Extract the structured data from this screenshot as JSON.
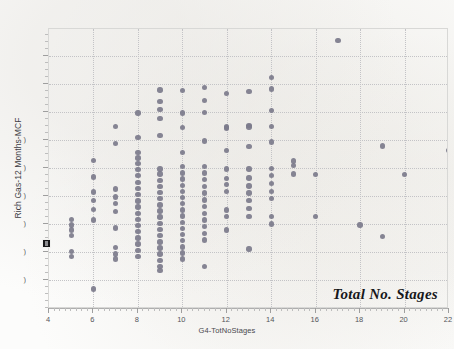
{
  "chart_data": {
    "type": "scatter",
    "title": "",
    "annotation": "Total No. Stages",
    "xlabel": "G4-TotNoStages",
    "ylabel": "Rich Gas-12 Months-MCF",
    "xlim": [
      4,
      22
    ],
    "ylim": [
      0,
      1
    ],
    "grid": true,
    "legend": null,
    "x_ticks": [
      4,
      6,
      8,
      10,
      12,
      14,
      16,
      18,
      20,
      22
    ],
    "x_tick_labels": [
      "4",
      "6",
      "8",
      "10",
      "12",
      "14",
      "16",
      "18",
      "20",
      "22"
    ],
    "x_minor_tick_step": 0.25,
    "y_ticks": [
      0.105,
      0.205,
      0.305,
      0.405,
      0.505,
      0.605,
      0.705,
      0.805,
      0.905
    ],
    "y_tick_labels": [
      "(",
      "(",
      "(",
      "(",
      "(",
      "(",
      "",
      "",
      ""
    ],
    "y_tick_labels_note": "y-axis numeric labels are clipped at the left edge of the screenshot; only partial glyph fragments are visible",
    "marker_color": "#7c7b8b",
    "marker_size_px": 5.4,
    "gridline_color": "#c3c3c6",
    "axis_color": "#aeaeae",
    "series": [
      {
        "name": "Rich Gas-12 Months-MCF vs Total No. Stages",
        "points": [
          [
            5,
            0.32
          ],
          [
            5,
            0.3
          ],
          [
            5,
            0.282
          ],
          [
            5,
            0.262
          ],
          [
            5,
            0.206
          ],
          [
            5,
            0.188
          ],
          [
            6,
            0.53
          ],
          [
            6,
            0.472
          ],
          [
            6,
            0.418
          ],
          [
            6,
            0.388
          ],
          [
            6,
            0.356
          ],
          [
            6,
            0.318
          ],
          [
            6,
            0.072
          ],
          [
            7,
            0.652
          ],
          [
            7,
            0.592
          ],
          [
            7,
            0.428
          ],
          [
            7,
            0.4
          ],
          [
            7,
            0.376
          ],
          [
            7,
            0.348
          ],
          [
            7,
            0.29
          ],
          [
            7,
            0.22
          ],
          [
            7,
            0.196
          ],
          [
            7,
            0.178
          ],
          [
            8,
            0.7
          ],
          [
            8,
            0.612
          ],
          [
            8,
            0.56
          ],
          [
            8,
            0.54
          ],
          [
            8,
            0.52
          ],
          [
            8,
            0.498
          ],
          [
            8,
            0.476
          ],
          [
            8,
            0.452
          ],
          [
            8,
            0.43
          ],
          [
            8,
            0.408
          ],
          [
            8,
            0.386
          ],
          [
            8,
            0.364
          ],
          [
            8,
            0.342
          ],
          [
            8,
            0.32
          ],
          [
            8,
            0.298
          ],
          [
            8,
            0.276
          ],
          [
            8,
            0.254
          ],
          [
            8,
            0.232
          ],
          [
            8,
            0.21
          ],
          [
            8,
            0.188
          ],
          [
            9,
            0.782
          ],
          [
            9,
            0.742
          ],
          [
            9,
            0.712
          ],
          [
            9,
            0.68
          ],
          [
            9,
            0.62
          ],
          [
            9,
            0.5
          ],
          [
            9,
            0.482
          ],
          [
            9,
            0.46
          ],
          [
            9,
            0.438
          ],
          [
            9,
            0.416
          ],
          [
            9,
            0.394
          ],
          [
            9,
            0.372
          ],
          [
            9,
            0.35
          ],
          [
            9,
            0.328
          ],
          [
            9,
            0.306
          ],
          [
            9,
            0.284
          ],
          [
            9,
            0.262
          ],
          [
            9,
            0.24
          ],
          [
            9,
            0.218
          ],
          [
            9,
            0.196
          ],
          [
            9,
            0.174
          ],
          [
            9,
            0.152
          ],
          [
            9,
            0.138
          ],
          [
            10,
            0.78
          ],
          [
            10,
            0.7
          ],
          [
            10,
            0.648
          ],
          [
            10,
            0.56
          ],
          [
            10,
            0.51
          ],
          [
            10,
            0.486
          ],
          [
            10,
            0.464
          ],
          [
            10,
            0.442
          ],
          [
            10,
            0.42
          ],
          [
            10,
            0.398
          ],
          [
            10,
            0.376
          ],
          [
            10,
            0.354
          ],
          [
            10,
            0.332
          ],
          [
            10,
            0.31
          ],
          [
            10,
            0.288
          ],
          [
            10,
            0.266
          ],
          [
            10,
            0.244
          ],
          [
            10,
            0.222
          ],
          [
            10,
            0.2
          ],
          [
            10,
            0.178
          ],
          [
            11,
            0.792
          ],
          [
            11,
            0.744
          ],
          [
            11,
            0.702
          ],
          [
            11,
            0.6
          ],
          [
            11,
            0.508
          ],
          [
            11,
            0.486
          ],
          [
            11,
            0.462
          ],
          [
            11,
            0.438
          ],
          [
            11,
            0.414
          ],
          [
            11,
            0.39
          ],
          [
            11,
            0.366
          ],
          [
            11,
            0.342
          ],
          [
            11,
            0.318
          ],
          [
            11,
            0.294
          ],
          [
            11,
            0.27
          ],
          [
            11,
            0.246
          ],
          [
            11,
            0.152
          ],
          [
            12,
            0.77
          ],
          [
            12,
            0.65
          ],
          [
            12,
            0.646
          ],
          [
            12,
            0.566
          ],
          [
            12,
            0.5
          ],
          [
            12,
            0.466
          ],
          [
            12,
            0.444
          ],
          [
            12,
            0.42
          ],
          [
            12,
            0.354
          ],
          [
            12,
            0.33
          ],
          [
            12,
            0.282
          ],
          [
            13,
            0.776
          ],
          [
            13,
            0.656
          ],
          [
            13,
            0.65
          ],
          [
            13,
            0.58
          ],
          [
            13,
            0.5
          ],
          [
            13,
            0.468
          ],
          [
            13,
            0.44
          ],
          [
            13,
            0.414
          ],
          [
            13,
            0.388
          ],
          [
            13,
            0.358
          ],
          [
            13,
            0.33
          ],
          [
            13,
            0.214
          ],
          [
            14,
            0.826
          ],
          [
            14,
            0.786
          ],
          [
            14,
            0.708
          ],
          [
            14,
            0.652
          ],
          [
            14,
            0.596
          ],
          [
            14,
            0.502
          ],
          [
            14,
            0.476
          ],
          [
            14,
            0.448
          ],
          [
            14,
            0.42
          ],
          [
            14,
            0.394
          ],
          [
            14,
            0.33
          ],
          [
            14,
            0.304
          ],
          [
            15,
            0.528
          ],
          [
            15,
            0.512
          ],
          [
            15,
            0.482
          ],
          [
            16,
            0.48
          ],
          [
            16,
            0.33
          ],
          [
            17,
            0.96
          ],
          [
            18,
            0.3
          ],
          [
            19,
            0.582
          ],
          [
            19,
            0.258
          ],
          [
            20,
            0.48
          ],
          [
            22,
            0.566
          ]
        ]
      }
    ]
  },
  "plot": {
    "x_axis_title": "G4-TotNoStages",
    "y_axis_title": "Rich Gas-12 Months-MCF",
    "annotation_text": "Total No. Stages"
  }
}
